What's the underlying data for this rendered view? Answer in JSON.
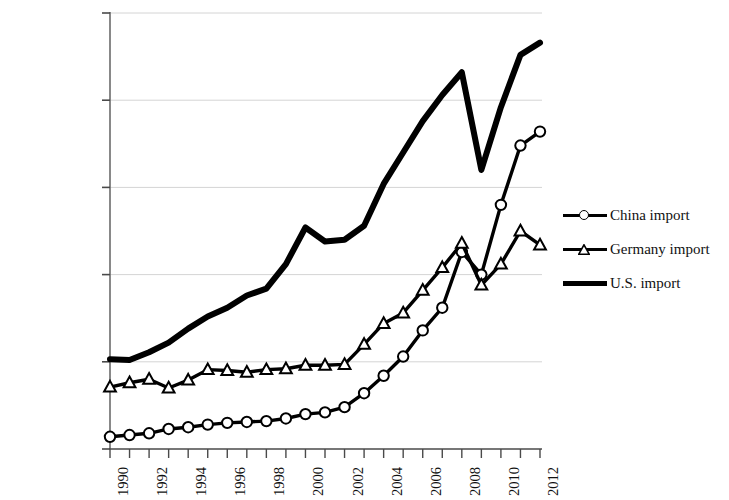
{
  "chart_data": {
    "type": "line",
    "title": "",
    "subtitle": "",
    "xlabel": "",
    "ylabel": "",
    "x": [
      1990,
      1991,
      1992,
      1993,
      1994,
      1995,
      1996,
      1997,
      1998,
      1999,
      2000,
      2001,
      2002,
      2003,
      2004,
      2005,
      2006,
      2007,
      2008,
      2009,
      2010,
      2011,
      2012
    ],
    "xlim": [
      1990,
      2012
    ],
    "ylim": [
      0,
      2500000
    ],
    "y_ticks": [
      0,
      500000,
      1000000,
      1500000,
      2000000,
      2500000
    ],
    "y_tick_labels": [
      "$-",
      "$5,00,000.00",
      "$10,00,000.00",
      "$15,00,000.00",
      "$20,00,000.00",
      "$25,00,000.00"
    ],
    "x_tick_labels": [
      "1990",
      "1992",
      "1994",
      "1996",
      "1998",
      "2000",
      "2002",
      "2004",
      "2006",
      "2008",
      "2010",
      "2012"
    ],
    "x_tick_label_interval": 2,
    "grid": "horizontal",
    "legend_position": "right",
    "series": [
      {
        "name": "China import",
        "marker": "circle",
        "color": "#000000",
        "values": [
          70000,
          80000,
          90000,
          115000,
          125000,
          140000,
          150000,
          155000,
          160000,
          175000,
          200000,
          210000,
          240000,
          320000,
          420000,
          530000,
          680000,
          810000,
          1130000,
          1000000,
          1400000,
          1740000,
          1820000
        ]
      },
      {
        "name": "Germany import",
        "marker": "triangle",
        "color": "#000000",
        "values": [
          355000,
          380000,
          400000,
          350000,
          395000,
          455000,
          450000,
          440000,
          455000,
          460000,
          480000,
          480000,
          485000,
          600000,
          720000,
          780000,
          910000,
          1040000,
          1180000,
          940000,
          1060000,
          1250000,
          1170000
        ]
      },
      {
        "name": "U.S. import",
        "marker": "none",
        "color": "#000000",
        "values": [
          515000,
          510000,
          555000,
          610000,
          690000,
          760000,
          810000,
          880000,
          920000,
          1060000,
          1270000,
          1190000,
          1200000,
          1280000,
          1520000,
          1700000,
          1880000,
          2030000,
          2160000,
          1600000,
          1960000,
          2260000,
          2330000
        ]
      }
    ]
  },
  "legend": {
    "items": [
      {
        "label": "China import",
        "marker": "circle"
      },
      {
        "label": "Germany import",
        "marker": "triangle"
      },
      {
        "label": "U.S. import",
        "marker": "none"
      }
    ]
  }
}
